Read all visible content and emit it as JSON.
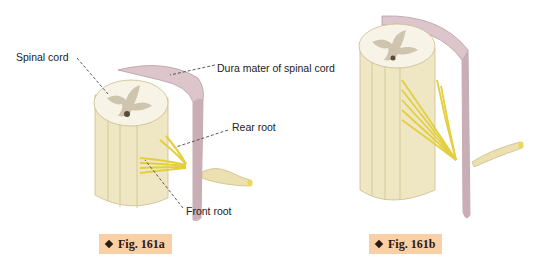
{
  "figures": [
    {
      "id": "fig-161a",
      "caption": "Fig. 161a",
      "labels": {
        "spinal_cord": "Spinal cord",
        "dura_mater": "Dura mater of spinal cord",
        "rear_root": "Rear root",
        "front_root": "Front root"
      }
    },
    {
      "id": "fig-161b",
      "caption": "Fig. 161b"
    }
  ],
  "colors": {
    "cord": "#efe6c4",
    "cord_shadow": "#dccf9f",
    "cord_top": "#f7f3e6",
    "grey_matter": "#cfc4ad",
    "dura": "#dcc6cc",
    "dura_dark": "#b89aa3",
    "nerve_roots": "#e9d85a",
    "spinal_nerve": "#ece0b0",
    "badge_bg": "#f9cfa6"
  }
}
